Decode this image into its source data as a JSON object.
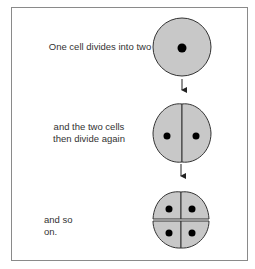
{
  "diagram": {
    "steps": [
      {
        "label_lines": [
          "One cell divides into two"
        ],
        "cell_count": 1
      },
      {
        "label_lines": [
          "and the two cells",
          "then divide again"
        ],
        "cell_count": 2
      },
      {
        "label_lines": [
          "and so on."
        ],
        "cell_count": 4
      }
    ],
    "colors": {
      "cell_fill": "#c8c8c8",
      "cell_stroke": "#333333",
      "nucleus": "#000000",
      "frame": "#8a8a8a",
      "arrow": "#222222"
    }
  }
}
